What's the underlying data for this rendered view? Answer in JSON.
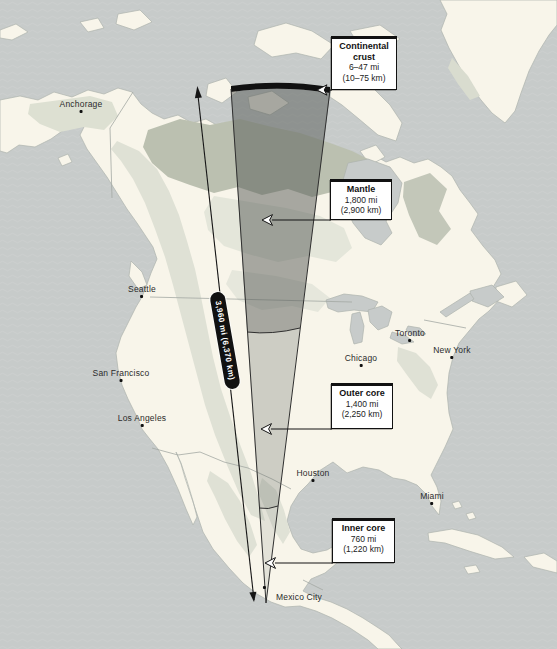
{
  "figure": {
    "radius_label": "3,960 mi (6,370 km)"
  },
  "callouts": {
    "crust": {
      "title": "Continental crust",
      "mi": "6–47 mi",
      "km": "(10–75 km)"
    },
    "mantle": {
      "title": "Mantle",
      "mi": "1,800 mi",
      "km": "(2,900 km)"
    },
    "outer_core": {
      "title": "Outer core",
      "mi": "1,400 mi",
      "km": "(2,250 km)"
    },
    "inner_core": {
      "title": "Inner core",
      "mi": "760 mi",
      "km": "(1,220 km)"
    }
  },
  "cities": {
    "anchorage": "Anchorage",
    "seattle": "Seattle",
    "san_francisco": "San Francisco",
    "los_angeles": "Los Angeles",
    "chicago": "Chicago",
    "toronto": "Toronto",
    "new_york": "New York",
    "houston": "Houston",
    "miami": "Miami",
    "mexico_city": "Mexico City"
  },
  "colors": {
    "water": "#c7cbca",
    "land": "#f8f5ea",
    "terrain_light": "#dfe1d5",
    "terrain_dark": "#bbc0b0",
    "crust_band": "#111111",
    "callout_border": "#111111"
  }
}
